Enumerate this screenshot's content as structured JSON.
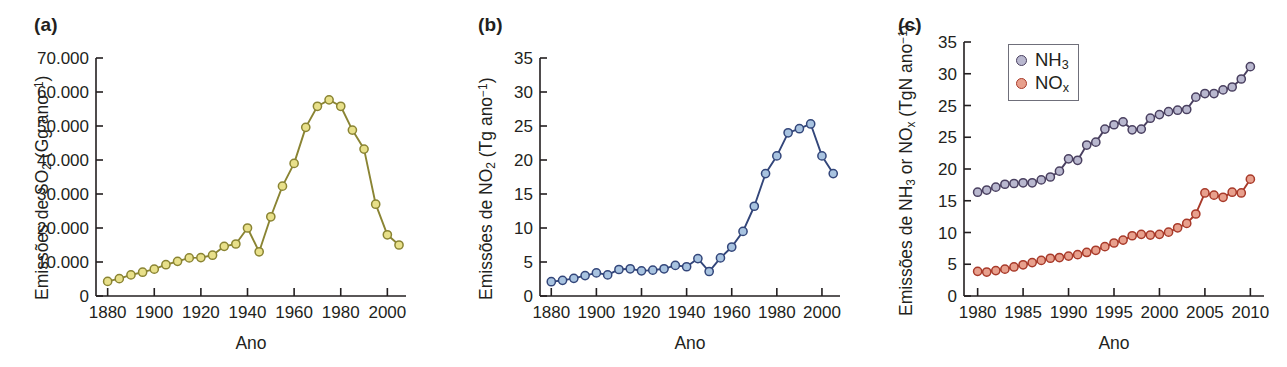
{
  "figure": {
    "panels": [
      {
        "tag": "(a)",
        "xlabel": "Ano",
        "ylabel_html": "Emissões de SO<sub>2</sub> (Gg ano<sup>−1</sup>)"
      },
      {
        "tag": "(b)",
        "xlabel": "Ano",
        "ylabel_html": "Emissões de NO<sub>2</sub> (Tg ano<sup>−1</sup>)"
      },
      {
        "tag": "(c)",
        "xlabel": "Ano",
        "ylabel_html": "Emissões de NH<sub>3</sub> or NO<sub>x</sub> (TgN ano<sup>−1</sup>)",
        "legend": [
          {
            "label_html": "NH<sub>3</sub>",
            "marker_fill": "#b9b8cf",
            "marker_stroke": "#4a4060"
          },
          {
            "label_html": "NO<sub>x</sub>",
            "marker_fill": "#e8a08d",
            "marker_stroke": "#a83a2a"
          }
        ]
      }
    ]
  },
  "chart_data": [
    {
      "type": "line",
      "panel": "(a)",
      "title": "",
      "xlabel": "Ano",
      "ylabel": "Emissões de SO2 (Gg ano-1)",
      "xlim": [
        1875,
        2008
      ],
      "ylim": [
        0,
        70000
      ],
      "xticks": [
        1880,
        1900,
        1920,
        1940,
        1960,
        1980,
        2000
      ],
      "yticks": [
        0,
        10000,
        20000,
        30000,
        40000,
        50000,
        60000,
        70000
      ],
      "ytick_labels": [
        "0",
        "10.000",
        "20.000",
        "30.000",
        "40.000",
        "50.000",
        "60.000",
        "70.000"
      ],
      "grid": false,
      "legend": "none",
      "line_color": "#8a8433",
      "marker_fill": "#e8e08a",
      "marker_stroke": "#8a8433",
      "series": [
        {
          "name": "SO2",
          "x": [
            1880,
            1885,
            1890,
            1895,
            1900,
            1905,
            1910,
            1915,
            1920,
            1925,
            1930,
            1935,
            1940,
            1945,
            1950,
            1955,
            1960,
            1965,
            1970,
            1975,
            1980,
            1985,
            1990,
            1995,
            2000,
            2005
          ],
          "values": [
            4300,
            5100,
            6200,
            7000,
            7900,
            9200,
            10200,
            11200,
            11300,
            12000,
            14600,
            15300,
            20000,
            13000,
            23300,
            32300,
            39000,
            49600,
            55800,
            57700,
            55800,
            48800,
            43200,
            27000,
            18000,
            15000
          ]
        }
      ]
    },
    {
      "type": "line",
      "panel": "(b)",
      "title": "",
      "xlabel": "Ano",
      "ylabel": "Emissões de NO2 (Tg ano-1)",
      "xlim": [
        1875,
        2008
      ],
      "ylim": [
        0,
        35
      ],
      "xticks": [
        1880,
        1900,
        1920,
        1940,
        1960,
        1980,
        2000
      ],
      "yticks": [
        0,
        5,
        10,
        15,
        20,
        25,
        30,
        35
      ],
      "ytick_labels": [
        "0",
        "5",
        "10",
        "15",
        "20",
        "25",
        "30",
        "35"
      ],
      "grid": false,
      "legend": "none",
      "line_color": "#33467a",
      "marker_fill": "#a8c3e0",
      "marker_stroke": "#33467a",
      "series": [
        {
          "name": "NO2",
          "x": [
            1880,
            1885,
            1890,
            1895,
            1900,
            1905,
            1910,
            1915,
            1920,
            1925,
            1930,
            1935,
            1940,
            1945,
            1950,
            1955,
            1960,
            1965,
            1970,
            1975,
            1980,
            1985,
            1990,
            1995,
            2000,
            2005
          ],
          "values": [
            2.1,
            2.3,
            2.6,
            3.0,
            3.4,
            3.1,
            3.9,
            4.0,
            3.7,
            3.8,
            4.0,
            4.5,
            4.3,
            5.5,
            3.6,
            5.6,
            7.2,
            9.5,
            13.2,
            18.0,
            20.6,
            24.0,
            24.6,
            25.3,
            20.6,
            18.0
          ]
        }
      ]
    },
    {
      "type": "line",
      "panel": "(c)",
      "title": "",
      "xlabel": "Ano",
      "ylabel": "Emissões de NH3 or NOx (TgN ano-1)",
      "xlim": [
        1978.5,
        2011.5
      ],
      "ylim": [
        0,
        35
      ],
      "xticks": [
        1980,
        1985,
        1990,
        1995,
        2000,
        2005,
        2010
      ],
      "yticks": [
        0,
        5,
        10,
        15,
        20,
        25,
        30,
        35
      ],
      "ytick_labels": [
        "0",
        "5",
        "10",
        "15",
        "20",
        "25",
        "25",
        "30",
        "35"
      ],
      "grid": false,
      "legend": "upper left",
      "series": [
        {
          "name": "NH3",
          "line_color": "#4a4060",
          "marker_fill": "#b9b8cf",
          "marker_stroke": "#4a4060",
          "x": [
            1980,
            1981,
            1982,
            1983,
            1984,
            1985,
            1986,
            1987,
            1988,
            1989,
            1990,
            1991,
            1992,
            1993,
            1994,
            1995,
            1996,
            1997,
            1998,
            1999,
            2000,
            2001,
            2002,
            2003,
            2004,
            2005,
            2006,
            2007,
            2008,
            2009,
            2010
          ],
          "values": [
            14.3,
            14.6,
            15.0,
            15.4,
            15.5,
            15.6,
            15.6,
            16.0,
            16.4,
            17.2,
            18.9,
            18.7,
            20.8,
            21.2,
            23.0,
            23.6,
            24.0,
            22.9,
            23.0,
            24.5,
            25.0,
            25.4,
            25.6,
            25.7,
            27.4,
            27.9,
            27.9,
            28.4,
            28.8,
            29.9,
            31.6
          ]
        },
        {
          "name": "NOx",
          "line_color": "#a83a2a",
          "marker_fill": "#e8a08d",
          "marker_stroke": "#a83a2a",
          "x": [
            1980,
            1981,
            1982,
            1983,
            1984,
            1985,
            1986,
            1987,
            1988,
            1989,
            1990,
            1991,
            1992,
            1993,
            1994,
            1995,
            1996,
            1997,
            1998,
            1999,
            2000,
            2001,
            2002,
            2003,
            2004,
            2005,
            2006,
            2007,
            2008,
            2009,
            2010
          ],
          "values": [
            3.4,
            3.3,
            3.5,
            3.7,
            4.0,
            4.3,
            4.6,
            4.9,
            5.2,
            5.3,
            5.5,
            5.7,
            6.0,
            6.3,
            6.8,
            7.3,
            7.7,
            8.3,
            8.5,
            8.4,
            8.5,
            8.8,
            9.4,
            10.0,
            11.3,
            14.2,
            13.9,
            13.6,
            14.3,
            14.2,
            16.1
          ]
        }
      ]
    }
  ]
}
